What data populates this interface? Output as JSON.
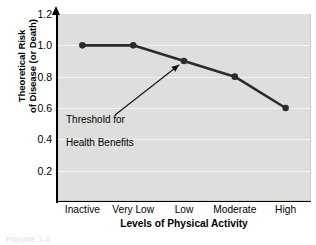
{
  "chart_data": {
    "type": "line",
    "title": "",
    "xlabel": "Levels of Physical Activity",
    "ylabel": "Theoretical Risk\nof Disease (or Death)",
    "ylabel_line1": "Theoretical Risk",
    "ylabel_line2": "of Disease (or Death)",
    "categories": [
      "Inactive",
      "Very Low",
      "Low",
      "Moderate",
      "High"
    ],
    "values": [
      1.0,
      1.0,
      0.9,
      0.8,
      0.6
    ],
    "ylim": [
      0.0,
      1.2
    ],
    "yticks": [
      "0.2",
      "0.4",
      "0.6",
      "0.8",
      "1.0",
      "1.2"
    ],
    "ytick_values": [
      0.2,
      0.4,
      0.6,
      0.8,
      1.0,
      1.2
    ],
    "grid": true,
    "legend": "none",
    "series_color": "#2b2b2b",
    "marker_color": "#2b2b2b",
    "plot_background": "#dededc",
    "gridline_color": "#f4f4f2",
    "axis_color": "#000000",
    "annotations": [
      {
        "text": "Threshold for\nHealth Benefits",
        "line1": "Threshold for",
        "line2": "Health Benefits",
        "points_to_category": "Low",
        "points_to_value": 0.9
      }
    ]
  },
  "axes": {
    "y_title_line1": "Theoretical Risk",
    "y_title_line2": "of Disease (or Death)",
    "x_title": "Levels of Physical Activity"
  },
  "figure": {
    "caption": "FIGURE 1-3"
  }
}
